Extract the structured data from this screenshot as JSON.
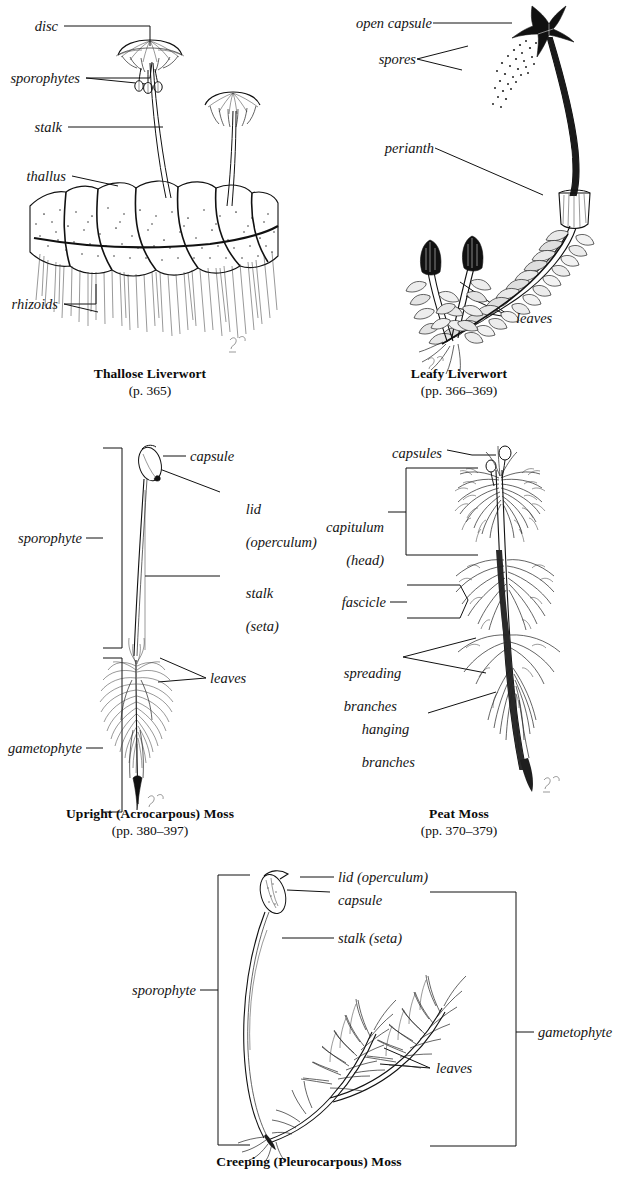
{
  "page": {
    "header_cut_text": "",
    "width": 618,
    "height": 1187,
    "ink_color": "#111111",
    "background_color": "#ffffff"
  },
  "figures": [
    {
      "id": "thallose-liverwort",
      "caption_name": "Thallose Liverwort",
      "caption_pages": "(p. 365)",
      "labels": [
        {
          "key": "disc",
          "text": "disc"
        },
        {
          "key": "sporophytes",
          "text": "sporophytes"
        },
        {
          "key": "stalk",
          "text": "stalk"
        },
        {
          "key": "thallus",
          "text": "thallus"
        },
        {
          "key": "rhizoids",
          "text": "rhizoids"
        }
      ]
    },
    {
      "id": "leafy-liverwort",
      "caption_name": "Leafy Liverwort",
      "caption_pages": "(pp. 366–369)",
      "labels": [
        {
          "key": "open-capsule",
          "text": "open capsule"
        },
        {
          "key": "spores",
          "text": "spores"
        },
        {
          "key": "perianth",
          "text": "perianth"
        },
        {
          "key": "leaves",
          "text": "leaves"
        }
      ]
    },
    {
      "id": "upright-acrocarpous-moss",
      "caption_name": "Upright (Acrocarpous) Moss",
      "caption_pages": "(pp. 380–397)",
      "labels": [
        {
          "key": "capsule",
          "text": "capsule"
        },
        {
          "key": "lid-line1",
          "text": "lid"
        },
        {
          "key": "lid-line2",
          "text": "(operculum)"
        },
        {
          "key": "stalk-line1",
          "text": "stalk"
        },
        {
          "key": "stalk-line2",
          "text": "(seta)"
        },
        {
          "key": "leaves",
          "text": "leaves"
        },
        {
          "key": "sporophyte",
          "text": "sporophyte"
        },
        {
          "key": "gametophyte",
          "text": "gametophyte"
        }
      ]
    },
    {
      "id": "peat-moss",
      "caption_name": "Peat Moss",
      "caption_pages": "(pp. 370–379)",
      "labels": [
        {
          "key": "capsules",
          "text": "capsules"
        },
        {
          "key": "capitulum-line1",
          "text": "capitulum"
        },
        {
          "key": "capitulum-line2",
          "text": "(head)"
        },
        {
          "key": "fascicle",
          "text": "fascicle"
        },
        {
          "key": "spreading-line1",
          "text": "spreading"
        },
        {
          "key": "spreading-line2",
          "text": "branches"
        },
        {
          "key": "hanging-line1",
          "text": "hanging"
        },
        {
          "key": "hanging-line2",
          "text": "branches"
        }
      ]
    },
    {
      "id": "creeping-pleurocarpous-moss",
      "caption_name": "Creeping (Pleurocarpous) Moss",
      "caption_pages": "",
      "labels": [
        {
          "key": "lid-operculum",
          "text": "lid (operculum)"
        },
        {
          "key": "capsule",
          "text": "capsule"
        },
        {
          "key": "stalk-seta",
          "text": "stalk (seta)"
        },
        {
          "key": "sporophyte",
          "text": "sporophyte"
        },
        {
          "key": "gametophyte",
          "text": "gametophyte"
        },
        {
          "key": "leaves",
          "text": "leaves"
        }
      ]
    }
  ]
}
